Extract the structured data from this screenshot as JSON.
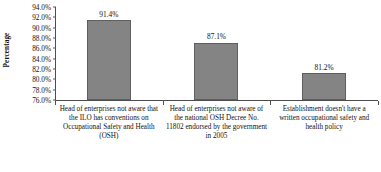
{
  "chart_data": {
    "type": "bar",
    "title": "",
    "xlabel": "",
    "ylabel": "Percentage",
    "ylim": [
      76.0,
      94.0
    ],
    "ytick_step": 2.0,
    "grid": false,
    "legend": false,
    "bar_color": "#848484",
    "bar_border_color": "#5f5f5f",
    "axis_color": "#4d4d4d",
    "categories": [
      "Head of enterprises not aware that the ILO has conventions on Occupational Safety and Health (OSH)",
      "Head of enterprises not aware of the national OSH Decree No. 11802 endorsed by the government in 2005",
      "Establishment doesn't have a written occupational safety and health policy"
    ],
    "values": [
      91.4,
      87.1,
      81.2
    ],
    "value_labels": [
      "91.4%",
      "87.1%",
      "81.2%"
    ],
    "ytick_labels": [
      "94.0%",
      "92.0%",
      "90.0%",
      "88.0%",
      "86.0%",
      "84.0%",
      "82.0%",
      "80.0%",
      "78.0%",
      "76.0%"
    ],
    "ytick_values": [
      94.0,
      92.0,
      90.0,
      88.0,
      86.0,
      84.0,
      82.0,
      80.0,
      78.0,
      76.0
    ]
  }
}
